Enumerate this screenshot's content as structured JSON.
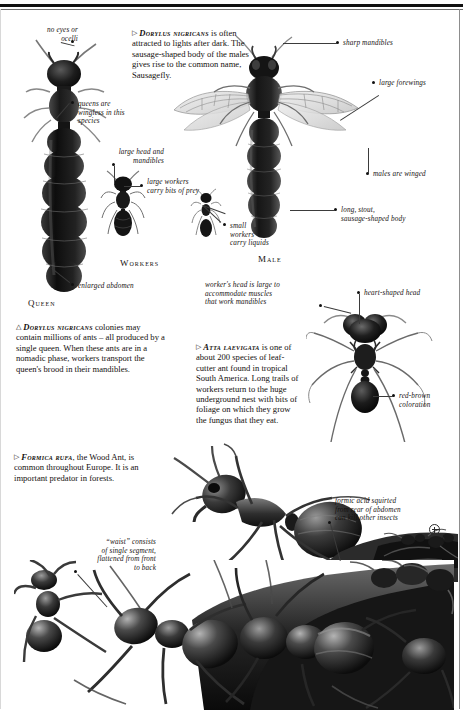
{
  "page": {
    "width": 463,
    "height": 715,
    "background": "#ffffff",
    "rule_color": "#111111"
  },
  "texts": {
    "dorylus_male_intro": "DORYLUS NIGRICANS is often attracted to lights after dark. The sausage-shaped body of the males gives rise to the common name, Sausagefly.",
    "dorylus_male_species": "Dorylus nigricans",
    "dorylus_male_rest": " is often attracted to lights after dark. The sausage-shaped body of the males gives rise to the common name, Sausagefly.",
    "dorylus_colony_species": "Dorylus nigricans",
    "dorylus_colony_rest": " colonies may contain millions of ants – all produced by a single queen. When these ants are in a nomadic phase, workers transport the queen's brood in their mandibles.",
    "atta_species": "Atta laevigata",
    "atta_rest": " is one of about 200 species of leaf-cutter ant found in tropical South America. Long trails of workers return to the huge underground nest with bits of foliage on which they grow the fungus that they eat.",
    "formica_species": "Formica rufa",
    "formica_rest": ", the Wood Ant, is common throughout Europe. It is an important predator in forests."
  },
  "headings": {
    "queen": "Queen",
    "workers": "Workers",
    "male": "Male"
  },
  "labels": {
    "no_eyes": "no eyes or\nocelli",
    "queens_wingless": "queens are\nwingless in this\nspecies",
    "large_head_mandibles": "large head and\nmandibles",
    "large_workers": "large workers\ncarry bits of prey",
    "small_workers": "small\nworkers\ncarry liquids",
    "enlarged_abdomen": "enlarged abdomen",
    "sharp_mandibles": "sharp mandibles",
    "large_forewings": "large forewings",
    "males_winged": "males are winged",
    "long_stout": "long, stout,\nsausage-shaped body",
    "workers_head": "worker's head is large to\naccommodate muscles\nthat work mandibles",
    "heart_shaped_head": "heart-shaped head",
    "red_brown": "red-brown\ncoloration",
    "long_thin_legs": "long, thin legs",
    "waist": "“waist” consists\nof single segment,\nflattened from front\nto back",
    "formic_acid": "formic acid squirted\nfrom rear of abdomen\ncan kill other insects"
  },
  "icons": {
    "magnifier": "magnifier-icon",
    "triangle_right": "▷",
    "triangle_up": "△"
  }
}
